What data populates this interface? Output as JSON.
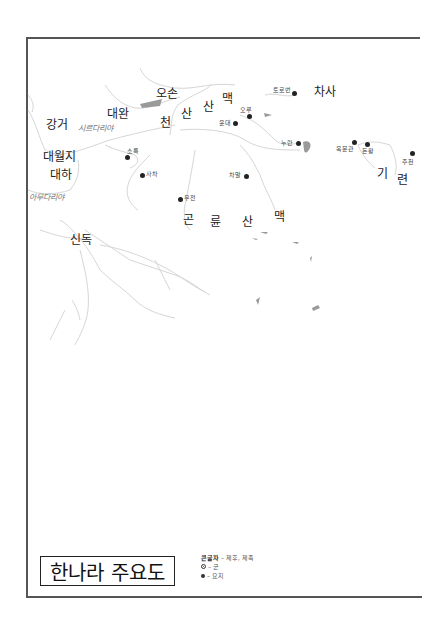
{
  "map": {
    "title": "한나라 주요도",
    "legend": {
      "big_text_label": "큰글자",
      "big_text_desc": " – 제후, 제족",
      "gun_icon": "circled-dot-icon",
      "gun_desc": "– 군",
      "yoji_icon": "filled-dot-icon",
      "yoji_desc": "– 요지"
    },
    "regions": {
      "oson": "오손",
      "daewan": "대완",
      "ganggeo": "강거",
      "daewolji": "대월지",
      "daeha": "대하",
      "sindok": "신독",
      "chasa": "차사"
    },
    "rivers": {
      "syr_darya": "시르다리야",
      "amu_darya": "아무다리야"
    },
    "mountains": {
      "tianshan": [
        "천",
        "산",
        "산",
        "맥"
      ],
      "kunlun": [
        "곤",
        "륜",
        "산",
        "맥"
      ],
      "qilian": [
        "기",
        "련"
      ]
    },
    "places": [
      {
        "name": "토로번"
      },
      {
        "name": "오루"
      },
      {
        "name": "윤대"
      },
      {
        "name": "누란"
      },
      {
        "name": "옥문관"
      },
      {
        "name": "돈황"
      },
      {
        "name": "주천"
      },
      {
        "name": "소륵"
      },
      {
        "name": "사차"
      },
      {
        "name": "우전"
      },
      {
        "name": "차말"
      }
    ],
    "colors": {
      "frame": "#555555",
      "river": "#d4d4d4",
      "lake": "#9a9a9a",
      "text": "#222222"
    }
  }
}
